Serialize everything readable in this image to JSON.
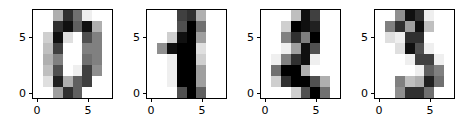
{
  "figure": {
    "width": 464,
    "height": 129,
    "background": "#ffffff",
    "panel_count": 4
  },
  "chart_data": {
    "type": "heatmap",
    "title": "",
    "xlabel": "",
    "ylabel": "",
    "colormap": "gray_r",
    "vmin": 0,
    "vmax": 16,
    "grid": false,
    "legend": "none",
    "xlim": [
      -0.5,
      7.5
    ],
    "ylim": [
      7.5,
      -0.5
    ],
    "xticks": [
      0,
      5
    ],
    "xtick_labels": [
      "0",
      "5"
    ],
    "yticks": [
      0,
      5
    ],
    "ytick_labels": [
      "0",
      "5"
    ],
    "panels": [
      {
        "index": 0,
        "label": "0",
        "matrix": [
          [
            0,
            0,
            5,
            13,
            9,
            1,
            0,
            0
          ],
          [
            0,
            0,
            13,
            15,
            10,
            15,
            5,
            0
          ],
          [
            0,
            3,
            15,
            2,
            0,
            11,
            8,
            0
          ],
          [
            0,
            4,
            12,
            0,
            0,
            8,
            8,
            0
          ],
          [
            0,
            5,
            8,
            0,
            0,
            9,
            8,
            0
          ],
          [
            0,
            4,
            11,
            0,
            1,
            12,
            7,
            0
          ],
          [
            0,
            2,
            14,
            5,
            10,
            12,
            0,
            0
          ],
          [
            0,
            0,
            6,
            13,
            10,
            0,
            0,
            0
          ]
        ]
      },
      {
        "index": 1,
        "label": "1",
        "matrix": [
          [
            0,
            0,
            0,
            12,
            13,
            5,
            0,
            0
          ],
          [
            0,
            0,
            0,
            11,
            16,
            9,
            0,
            0
          ],
          [
            0,
            0,
            3,
            15,
            16,
            6,
            0,
            0
          ],
          [
            0,
            7,
            15,
            16,
            16,
            2,
            0,
            0
          ],
          [
            0,
            0,
            1,
            16,
            16,
            3,
            0,
            0
          ],
          [
            0,
            0,
            1,
            16,
            16,
            6,
            0,
            0
          ],
          [
            0,
            0,
            1,
            16,
            16,
            6,
            0,
            0
          ],
          [
            0,
            0,
            0,
            11,
            16,
            10,
            0,
            0
          ]
        ]
      },
      {
        "index": 2,
        "label": "2",
        "matrix": [
          [
            0,
            0,
            0,
            4,
            15,
            12,
            0,
            0
          ],
          [
            0,
            0,
            3,
            16,
            15,
            14,
            0,
            0
          ],
          [
            0,
            0,
            8,
            13,
            8,
            16,
            0,
            0
          ],
          [
            0,
            0,
            1,
            6,
            15,
            11,
            0,
            0
          ],
          [
            0,
            1,
            8,
            13,
            15,
            1,
            0,
            0
          ],
          [
            0,
            9,
            16,
            16,
            5,
            0,
            0,
            0
          ],
          [
            0,
            3,
            13,
            16,
            16,
            11,
            5,
            0
          ],
          [
            0,
            0,
            0,
            3,
            11,
            16,
            9,
            0
          ]
        ]
      },
      {
        "index": 3,
        "label": "3",
        "matrix": [
          [
            0,
            0,
            7,
            15,
            13,
            1,
            0,
            0
          ],
          [
            0,
            8,
            13,
            6,
            15,
            4,
            0,
            0
          ],
          [
            0,
            2,
            1,
            13,
            13,
            0,
            0,
            0
          ],
          [
            0,
            0,
            2,
            15,
            11,
            1,
            0,
            0
          ],
          [
            0,
            0,
            0,
            1,
            12,
            12,
            1,
            0
          ],
          [
            0,
            0,
            0,
            0,
            1,
            10,
            8,
            0
          ],
          [
            0,
            0,
            8,
            4,
            5,
            14,
            9,
            0
          ],
          [
            0,
            0,
            7,
            13,
            13,
            9,
            0,
            0
          ]
        ]
      }
    ],
    "panel_geometry": [
      {
        "left": 32,
        "top": 9,
        "width": 81,
        "height": 90
      },
      {
        "left": 146,
        "top": 9,
        "width": 81,
        "height": 90
      },
      {
        "left": 260,
        "top": 9,
        "width": 81,
        "height": 90
      },
      {
        "left": 374,
        "top": 9,
        "width": 81,
        "height": 90
      }
    ]
  }
}
